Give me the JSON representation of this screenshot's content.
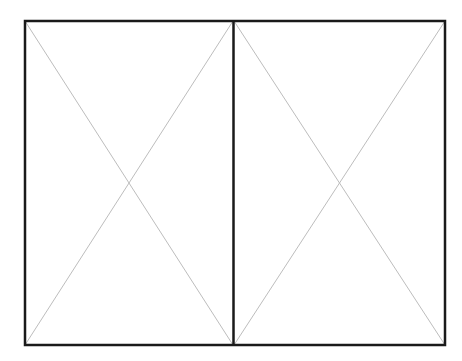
{
  "placeholders": [
    {
      "name": "left-image-placeholder",
      "x": 24,
      "y": 20,
      "w": 209,
      "h": 326
    },
    {
      "name": "right-image-placeholder",
      "x": 233,
      "y": 20,
      "w": 213,
      "h": 326
    }
  ],
  "colors": {
    "border": "#1a1a1a",
    "cross": "#bdbdbd",
    "background": "#ffffff"
  }
}
